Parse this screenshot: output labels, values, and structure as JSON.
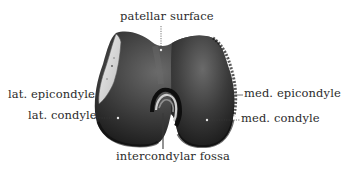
{
  "figure": {
    "labels": {
      "patellar_surface": "patellar surface",
      "lat_epicondyle": "lat. epicondyle",
      "lat_condyle": "lat. condyle",
      "med_epicondyle": "med. epicondyle",
      "med_condyle": "med. condyle",
      "intercondylar_fossa": "intercondylar fossa"
    },
    "colors": {
      "background": "#ffffff",
      "label_text": "#2b2b2b",
      "leader_line": "#3a3a3a",
      "bone_dark": "#1e1e1e",
      "bone_mid": "#4a4a4a",
      "bone_light": "#8a8a8a",
      "facet_light": "#d8d8d8"
    }
  }
}
